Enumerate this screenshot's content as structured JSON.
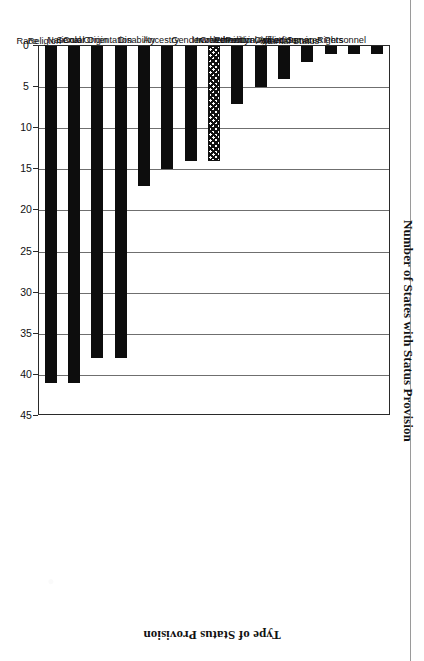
{
  "chart_data": {
    "type": "bar",
    "title": "",
    "xlabel": "Type of Status Provision",
    "ylabel": "Number of States with Status Provision",
    "orientation": "vertical-rotated-90",
    "grid": true,
    "legend": "none",
    "ylim": [
      0,
      45
    ],
    "ytick_step": 5,
    "yticks": [
      "0",
      "5",
      "10",
      "15",
      "20",
      "25",
      "30",
      "35",
      "40",
      "45"
    ],
    "categories": [
      "Involvement in Armed Services Personnel",
      "Involvement in Civil or Human Rights",
      "Marital Status",
      "Political Affiliation",
      "Age",
      "Ethnicity",
      "Creed",
      "Gender",
      "Ancestry",
      "Disability",
      "Sexual Orientation",
      "National Origin",
      "Color",
      "Religion",
      "Race"
    ],
    "values": [
      1,
      1,
      1,
      2,
      4,
      5,
      7,
      14,
      14,
      15,
      17,
      38,
      38,
      41,
      41
    ],
    "bar_styles": [
      "solid",
      "solid",
      "solid",
      "solid",
      "solid",
      "solid",
      "solid",
      "hatched",
      "solid",
      "solid",
      "solid",
      "solid",
      "solid",
      "solid",
      "solid"
    ]
  },
  "colors": {
    "bar_fill": "#0d0d0d",
    "hatch_line": "#111111",
    "grid": "#6f6f6f",
    "frame": "#2a2a2a",
    "background": "#ffffff",
    "text": "#111111"
  }
}
